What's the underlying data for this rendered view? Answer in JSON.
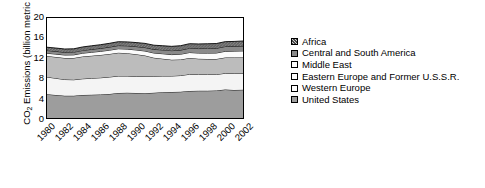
{
  "chart_data": {
    "type": "area",
    "stacked": true,
    "title": "",
    "xlabel": "",
    "ylabel": "CO2 Emissions (billion metric tons)",
    "ylabel_parts": {
      "prefix": "CO",
      "sub": "2",
      "suffix": " Emissions (billion metric tons)"
    },
    "ylim": [
      0,
      20
    ],
    "yticks": [
      0,
      4,
      8,
      12,
      16,
      20
    ],
    "xlim": [
      1980,
      2002
    ],
    "xticks": [
      1980,
      1982,
      1984,
      1986,
      1988,
      1990,
      1992,
      1994,
      1996,
      1998,
      2000,
      2002
    ],
    "xtick_labels": [
      "1980",
      "1982",
      "1984",
      "1986",
      "1988",
      "1990",
      "1992",
      "1994",
      "1996",
      "1998",
      "2000",
      "2002"
    ],
    "x": [
      1980,
      1981,
      1982,
      1983,
      1984,
      1985,
      1986,
      1987,
      1988,
      1989,
      1990,
      1991,
      1992,
      1993,
      1994,
      1995,
      1996,
      1997,
      1998,
      1999,
      2000,
      2001,
      2002
    ],
    "grid": false,
    "legend_position": "right",
    "series": [
      {
        "name": "United States",
        "fill": "#9a9a9a",
        "pattern": "solid-dark-gray",
        "values": [
          4.75,
          4.6,
          4.45,
          4.45,
          4.6,
          4.65,
          4.7,
          4.8,
          5.0,
          5.05,
          5.0,
          4.95,
          5.05,
          5.15,
          5.2,
          5.25,
          5.4,
          5.45,
          5.45,
          5.5,
          5.7,
          5.6,
          5.65
        ]
      },
      {
        "name": "Western Europe",
        "fill": "#f2f2f2",
        "pattern": "light",
        "values": [
          3.45,
          3.35,
          3.25,
          3.2,
          3.25,
          3.3,
          3.35,
          3.4,
          3.4,
          3.35,
          3.3,
          3.4,
          3.3,
          3.25,
          3.2,
          3.25,
          3.35,
          3.25,
          3.25,
          3.2,
          3.25,
          3.3,
          3.25
        ]
      },
      {
        "name": "Eastern Europe and Former U.S.S.R.",
        "fill": "#b8b8b8",
        "pattern": "medium-gray",
        "values": [
          4.2,
          4.25,
          4.3,
          4.35,
          4.45,
          4.5,
          4.55,
          4.6,
          4.65,
          4.55,
          4.45,
          4.15,
          3.7,
          3.45,
          3.25,
          3.2,
          3.25,
          3.15,
          3.1,
          3.1,
          3.15,
          3.2,
          3.2
        ]
      },
      {
        "name": "Middle East",
        "fill": "#fafafa",
        "pattern": "white",
        "values": [
          0.55,
          0.58,
          0.6,
          0.63,
          0.66,
          0.7,
          0.73,
          0.76,
          0.8,
          0.83,
          0.86,
          0.9,
          0.95,
          1.0,
          1.03,
          1.06,
          1.1,
          1.14,
          1.18,
          1.2,
          1.24,
          1.28,
          1.32
        ]
      },
      {
        "name": "Central and South America",
        "fill": "#808080",
        "pattern": "dark-gray",
        "values": [
          0.55,
          0.55,
          0.54,
          0.54,
          0.56,
          0.58,
          0.6,
          0.62,
          0.64,
          0.66,
          0.68,
          0.7,
          0.73,
          0.76,
          0.79,
          0.82,
          0.86,
          0.9,
          0.93,
          0.94,
          0.96,
          0.95,
          0.98
        ]
      },
      {
        "name": "Africa",
        "fill": "#707070",
        "pattern": "hatched-dark",
        "values": [
          0.65,
          0.66,
          0.66,
          0.67,
          0.69,
          0.71,
          0.73,
          0.75,
          0.77,
          0.78,
          0.8,
          0.82,
          0.83,
          0.84,
          0.86,
          0.88,
          0.9,
          0.92,
          0.94,
          0.95,
          0.97,
          0.98,
          1.0
        ]
      }
    ],
    "totals": [
      14.15,
      13.99,
      13.8,
      13.84,
      14.21,
      14.44,
      14.66,
      14.93,
      15.26,
      15.22,
      15.09,
      14.92,
      14.56,
      14.45,
      14.33,
      14.46,
      14.86,
      14.81,
      14.85,
      14.89,
      15.27,
      15.31,
      15.4
    ]
  },
  "legend": {
    "items": [
      {
        "label": "Africa"
      },
      {
        "label": "Central and South America"
      },
      {
        "label": "Middle East"
      },
      {
        "label": "Eastern Europe and Former U.S.S.R."
      },
      {
        "label": "Western Europe"
      },
      {
        "label": "United States"
      }
    ]
  }
}
